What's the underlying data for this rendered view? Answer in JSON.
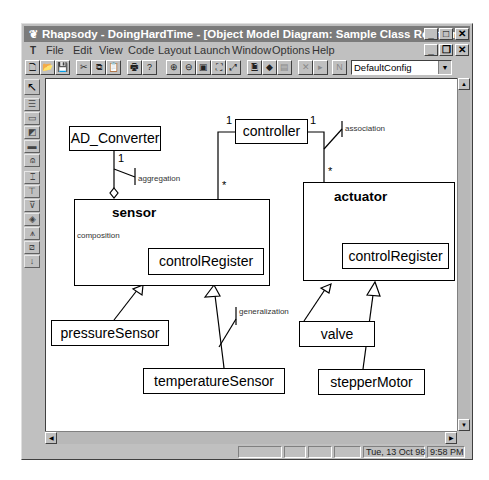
{
  "window": {
    "title": "Rhapsody - DoingHardTime - [Object Model Diagram: Sample Class Relations]",
    "app_icon": "rhapsody-icon",
    "controls": [
      "minimize",
      "maximize",
      "close"
    ],
    "mdi_controls": [
      "minimize",
      "restore",
      "close"
    ]
  },
  "menubar": {
    "items": [
      {
        "label": "File",
        "accel": "F"
      },
      {
        "label": "Edit",
        "accel": "E"
      },
      {
        "label": "View",
        "accel": "V"
      },
      {
        "label": "Code",
        "accel": "C"
      },
      {
        "label": "Layout",
        "accel": "a"
      },
      {
        "label": "Launch",
        "accel": "L"
      },
      {
        "label": "Window",
        "accel": "W"
      },
      {
        "label": "Options",
        "accel": "O"
      },
      {
        "label": "Help",
        "accel": "H"
      }
    ]
  },
  "toolbar": {
    "buttons": [
      {
        "name": "new-file",
        "glyph": "🗋"
      },
      {
        "name": "open-file",
        "glyph": "📂"
      },
      {
        "name": "save",
        "glyph": "💾"
      },
      {
        "name": "cut",
        "glyph": "✂"
      },
      {
        "name": "copy",
        "glyph": "⧉"
      },
      {
        "name": "paste",
        "glyph": "📋"
      },
      {
        "name": "print",
        "glyph": "🖶"
      },
      {
        "name": "help",
        "glyph": "?"
      },
      {
        "name": "zoom-in",
        "glyph": "⊕"
      },
      {
        "name": "zoom-out",
        "glyph": "⊖"
      },
      {
        "name": "zoom-to-fit",
        "glyph": "▣"
      },
      {
        "name": "fit-all",
        "glyph": "⛶"
      },
      {
        "name": "undo-zoom",
        "glyph": "⤢"
      },
      {
        "name": "generate-code",
        "glyph": "🗎"
      },
      {
        "name": "make",
        "glyph": "◆"
      },
      {
        "name": "run",
        "glyph": "▤"
      },
      {
        "name": "stop",
        "glyph": "✕"
      },
      {
        "name": "step",
        "glyph": "▸"
      },
      {
        "name": "animate",
        "glyph": "N"
      }
    ],
    "config_select": {
      "value": "DefaultConfig"
    }
  },
  "palette": {
    "tools": [
      "select",
      "class",
      "package",
      "object",
      "composite",
      "actor",
      "association",
      "directed-association",
      "aggregation",
      "composition",
      "generalization",
      "dependency",
      "link"
    ]
  },
  "diagram": {
    "classes": [
      {
        "id": "AD_Converter",
        "name": "AD_Converter"
      },
      {
        "id": "controller",
        "name": "controller"
      },
      {
        "id": "sensor",
        "name": "sensor",
        "parts": [
          {
            "name": "controlRegister"
          }
        ]
      },
      {
        "id": "actuator",
        "name": "actuator",
        "parts": [
          {
            "name": "controlRegister"
          }
        ]
      },
      {
        "id": "pressureSensor",
        "name": "pressureSensor"
      },
      {
        "id": "temperatureSensor",
        "name": "temperatureSensor"
      },
      {
        "id": "valve",
        "name": "valve"
      },
      {
        "id": "stepperMotor",
        "name": "stepperMotor"
      }
    ],
    "relations": [
      {
        "type": "aggregation",
        "label": "aggregation",
        "from": "AD_Converter",
        "to": "sensor",
        "mult_from": "1"
      },
      {
        "type": "association",
        "from": "controller",
        "to": "sensor",
        "mult_from": "1",
        "mult_to": "*"
      },
      {
        "type": "association",
        "label": "association",
        "from": "controller",
        "to": "actuator",
        "mult_from": "1",
        "mult_to": "*"
      },
      {
        "type": "composition",
        "label": "composition",
        "from": "sensor",
        "to": "controlRegister"
      },
      {
        "type": "generalization",
        "from": "pressureSensor",
        "to": "sensor"
      },
      {
        "type": "generalization",
        "label": "generalization",
        "from": "temperatureSensor",
        "to": "sensor"
      },
      {
        "type": "generalization",
        "from": "valve",
        "to": "actuator"
      },
      {
        "type": "generalization",
        "from": "stepperMotor",
        "to": "actuator"
      }
    ],
    "labels": {
      "aggregation": "aggregation",
      "association": "association",
      "composition": "composition",
      "generalization": "generalization"
    },
    "multiplicities": {
      "ad_one": "1",
      "ctrl_left_one": "1",
      "ctrl_right_one": "1",
      "sensor_many": "*",
      "actuator_many": "*"
    }
  },
  "statusbar": {
    "panels": [
      "",
      "",
      "",
      ""
    ],
    "date": "Tue, 13 Oct 98",
    "time": "9:58 PM"
  }
}
